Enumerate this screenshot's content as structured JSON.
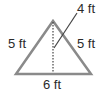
{
  "diagram": {
    "shape": "isosceles triangle",
    "labels": {
      "left_side": "5 ft",
      "right_side": "5 ft",
      "base": "6 ft",
      "height": "4 ft"
    },
    "colors": {
      "triangle_stroke": "#8a8a8a",
      "altitude_stroke": "#444444",
      "leader_stroke": "#444444",
      "text": "#2a2a2a"
    }
  }
}
